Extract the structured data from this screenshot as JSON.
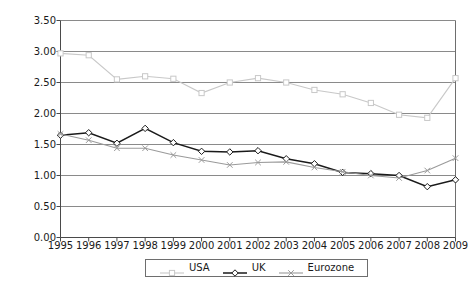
{
  "chart_data": {
    "type": "line",
    "title": "",
    "xlabel": "",
    "ylabel": "Interest margin (%)",
    "x": [
      1995,
      1996,
      1997,
      1998,
      1999,
      2000,
      2001,
      2002,
      2003,
      2004,
      2005,
      2006,
      2007,
      2008,
      2009
    ],
    "categories": [
      "1995",
      "1996",
      "1997",
      "1998",
      "1999",
      "2000",
      "2001",
      "2002",
      "2003",
      "2004",
      "2005",
      "2006",
      "2007",
      "2008",
      "2009"
    ],
    "ylim": [
      0.0,
      3.5
    ],
    "yticks": [
      0.0,
      0.5,
      1.0,
      1.5,
      2.0,
      2.5,
      3.0,
      3.5
    ],
    "ytick_labels": [
      "0.00",
      "0.50",
      "1.00",
      "1.50",
      "2.00",
      "2.50",
      "3.00",
      "3.50"
    ],
    "grid": true,
    "grid_axis": "y",
    "legend_position": "bottom",
    "series": [
      {
        "name": "USA",
        "color": "#c8c8c8",
        "marker": "square",
        "values": [
          2.97,
          2.94,
          2.55,
          2.6,
          2.56,
          2.33,
          2.5,
          2.57,
          2.5,
          2.38,
          2.31,
          2.17,
          1.98,
          1.93,
          2.57
        ]
      },
      {
        "name": "UK",
        "color": "#1a1a1a",
        "marker": "diamond",
        "values": [
          1.65,
          1.69,
          1.52,
          1.76,
          1.53,
          1.39,
          1.38,
          1.4,
          1.27,
          1.19,
          1.05,
          1.03,
          1.0,
          0.82,
          0.93
        ]
      },
      {
        "name": "Eurozone",
        "color": "#9a9a9a",
        "marker": "x",
        "values": [
          1.67,
          1.57,
          1.44,
          1.44,
          1.33,
          1.25,
          1.17,
          1.21,
          1.22,
          1.13,
          1.06,
          1.0,
          0.96,
          1.08,
          1.28
        ]
      }
    ]
  },
  "legend": {
    "items": [
      {
        "label": "USA"
      },
      {
        "label": "UK"
      },
      {
        "label": "Eurozone"
      }
    ]
  },
  "axes": {
    "y_title": "Interest margin (%)"
  }
}
